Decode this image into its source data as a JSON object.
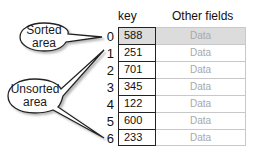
{
  "callouts": {
    "sorted": {
      "line1": "Sorted",
      "line2": "area",
      "points_to_indices": [
        0
      ]
    },
    "unsorted": {
      "line1": "Unsorted",
      "line2": "area",
      "points_to_indices": [
        1,
        6
      ]
    }
  },
  "table": {
    "headers": {
      "key": "key",
      "other": "Other fields"
    },
    "rows": [
      {
        "index": "0",
        "key": "588",
        "data": "Data",
        "sorted": true
      },
      {
        "index": "1",
        "key": "251",
        "data": "Data",
        "sorted": false
      },
      {
        "index": "2",
        "key": "701",
        "data": "Data",
        "sorted": false
      },
      {
        "index": "3",
        "key": "345",
        "data": "Data",
        "sorted": false
      },
      {
        "index": "4",
        "key": "122",
        "data": "Data",
        "sorted": false
      },
      {
        "index": "5",
        "key": "600",
        "data": "Data",
        "sorted": false
      },
      {
        "index": "6",
        "key": "233",
        "data": "Data",
        "sorted": false
      }
    ]
  },
  "colors": {
    "sorted_fill": "#dcdcdc",
    "data_text": "#a8a8a8",
    "border": "#222222"
  }
}
